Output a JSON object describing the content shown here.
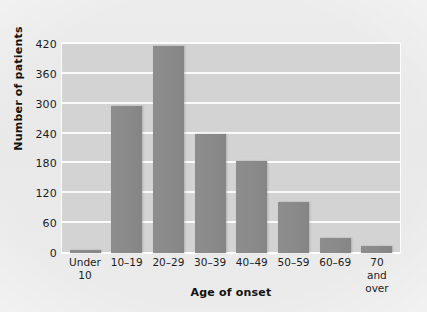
{
  "chart_data": {
    "type": "bar",
    "title": "",
    "xlabel": "Age of onset",
    "ylabel": "Number of patients",
    "categories": [
      "Under 10",
      "10–19",
      "20–29",
      "30–39",
      "40–49",
      "50–59",
      "60–69",
      "70 and over"
    ],
    "category_lines": [
      [
        "Under",
        "10"
      ],
      [
        "10–19",
        ""
      ],
      [
        "20–29",
        ""
      ],
      [
        "30–39",
        ""
      ],
      [
        "40–49",
        ""
      ],
      [
        "50–59",
        ""
      ],
      [
        "60–69",
        ""
      ],
      [
        "70 and",
        "over"
      ]
    ],
    "values": [
      5,
      295,
      417,
      240,
      184,
      102,
      30,
      14
    ],
    "ylim": [
      0,
      420
    ],
    "yticks": [
      0,
      60,
      120,
      180,
      240,
      300,
      360,
      420
    ],
    "ytick_labels": [
      "0",
      "60",
      "120",
      "180",
      "240",
      "300",
      "360",
      "420"
    ],
    "grid": true,
    "grid_color": "#fbfbfb",
    "legend": "none",
    "bar_color": "#8a8a8a",
    "plot_background": "#d3d3d3",
    "page_background": "#eaeaeb"
  }
}
